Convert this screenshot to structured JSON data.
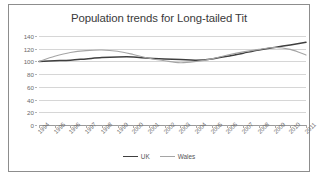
{
  "chart_data": {
    "type": "line",
    "title": "Population trends for Long-tailed Tit",
    "xlabel": "",
    "ylabel": "",
    "ylim": [
      0,
      140
    ],
    "yticks": [
      0,
      20,
      40,
      60,
      80,
      100,
      120,
      140
    ],
    "grid": true,
    "legend_position": "bottom",
    "categories": [
      "1994",
      "1995",
      "1996",
      "1997",
      "1998",
      "1999",
      "2000",
      "2001",
      "2002",
      "2003",
      "2004",
      "2005",
      "2006",
      "2007",
      "2008",
      "2009",
      "2010",
      "2011"
    ],
    "series": [
      {
        "name": "UK",
        "color": "#3f3f3f",
        "values": [
          100,
          101,
          102,
          104,
          106,
          107,
          107,
          105,
          104,
          103,
          102,
          104,
          108,
          113,
          118,
          122,
          126,
          130
        ]
      },
      {
        "name": "Wales",
        "color": "#a5a5a5",
        "values": [
          100,
          108,
          114,
          117,
          118,
          116,
          111,
          105,
          101,
          98,
          100,
          104,
          110,
          115,
          119,
          122,
          119,
          110
        ]
      }
    ]
  },
  "legend": {
    "items": [
      {
        "label": "UK",
        "color": "#3f3f3f"
      },
      {
        "label": "Wales",
        "color": "#a5a5a5"
      }
    ]
  }
}
